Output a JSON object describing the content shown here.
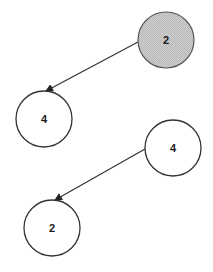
{
  "diagram": {
    "type": "graph",
    "colors": {
      "stroke": "#333333",
      "highlight_fill": "#c8c8c8",
      "node_fill": "#ffffff",
      "text": "#1a1a1a"
    },
    "nodes": [
      {
        "id": "n1",
        "label": "2",
        "cx": 166,
        "cy": 40,
        "r": 28,
        "highlighted": true
      },
      {
        "id": "n2",
        "label": "4",
        "cx": 44,
        "cy": 119,
        "r": 28,
        "highlighted": false
      },
      {
        "id": "n3",
        "label": "4",
        "cx": 173,
        "cy": 148,
        "r": 28,
        "highlighted": false
      },
      {
        "id": "n4",
        "label": "2",
        "cx": 52,
        "cy": 228,
        "r": 28,
        "highlighted": false
      }
    ],
    "edges": [
      {
        "from": "n1",
        "to": "n2",
        "x1": 138,
        "y1": 42,
        "x2": 46,
        "y2": 91,
        "directed": true
      },
      {
        "from": "n3",
        "to": "n4",
        "x1": 145,
        "y1": 149,
        "x2": 55,
        "y2": 200,
        "directed": true
      }
    ]
  }
}
